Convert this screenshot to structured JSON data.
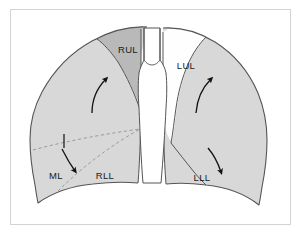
{
  "figure": {
    "frame_color": "#d3d3d3",
    "background_color": "#ffffff",
    "outline_color": "#555555",
    "fissure_color": "#555555",
    "dashed_fissure_color": "#9a9a9a",
    "arrow_color": "#111111"
  },
  "regions": {
    "right_upper_lobe": {
      "label": "RUL",
      "fill": "#b9b9b9",
      "label_x": 128,
      "label_y": 50
    },
    "right_middle_lobe": {
      "label": "ML",
      "fill": "#d8d8d8",
      "label_x": 56,
      "label_y": 176
    },
    "right_lower_lobe": {
      "label": "RLL",
      "fill": "#d8d8d8",
      "label_x": 105,
      "label_y": 176
    },
    "left_upper_lobe": {
      "label": "LUL",
      "fill": "#fefefe",
      "label_x": 186,
      "label_y": 66
    },
    "left_lower_lobe": {
      "label": "LLL",
      "fill": "#d8d8d8",
      "label_x": 202,
      "label_y": 178
    },
    "trachea": {
      "fill": "#ffffff"
    }
  },
  "arrows": [
    {
      "name": "right-upper-arrow",
      "direction": "up-right"
    },
    {
      "name": "right-middle-arrow",
      "direction": "down"
    },
    {
      "name": "left-upper-arrow",
      "direction": "up-right"
    },
    {
      "name": "left-lower-arrow",
      "direction": "down-right"
    }
  ],
  "tick_marks": [
    {
      "name": "right-fissure-tick"
    }
  ]
}
